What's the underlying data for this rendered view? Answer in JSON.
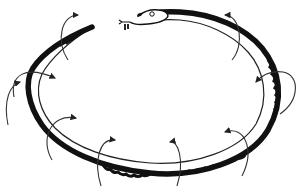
{
  "diagram": {
    "colors": {
      "background": "#ffffff",
      "ink": "#111111",
      "arrow": "#333333"
    },
    "elements": {
      "snake_head": "snake-head",
      "snake_body": "snake-body-ring",
      "snake_tail": "snake-tail",
      "arrows_count": 9
    }
  }
}
